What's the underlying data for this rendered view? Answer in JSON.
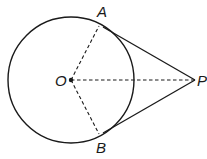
{
  "diagram": {
    "type": "circle-with-tangents",
    "labels": {
      "center": "O",
      "tangent_point_top": "A",
      "tangent_point_bottom": "B",
      "external_point": "P"
    },
    "colors": {
      "stroke": "#1a1a1a",
      "background": "#ffffff"
    },
    "points": {
      "O": [
        71,
        80
      ],
      "A": [
        99,
        26
      ],
      "B": [
        99,
        134
      ],
      "P": [
        195,
        80
      ]
    },
    "circle": {
      "cx": 71,
      "cy": 80,
      "r": 63
    },
    "segments": [
      {
        "from": "O",
        "to": "A",
        "style": "dashed"
      },
      {
        "from": "O",
        "to": "B",
        "style": "dashed"
      },
      {
        "from": "O",
        "to": "P",
        "style": "dashed"
      },
      {
        "from": "A",
        "to": "P",
        "style": "solid"
      },
      {
        "from": "B",
        "to": "P",
        "style": "solid"
      }
    ]
  }
}
